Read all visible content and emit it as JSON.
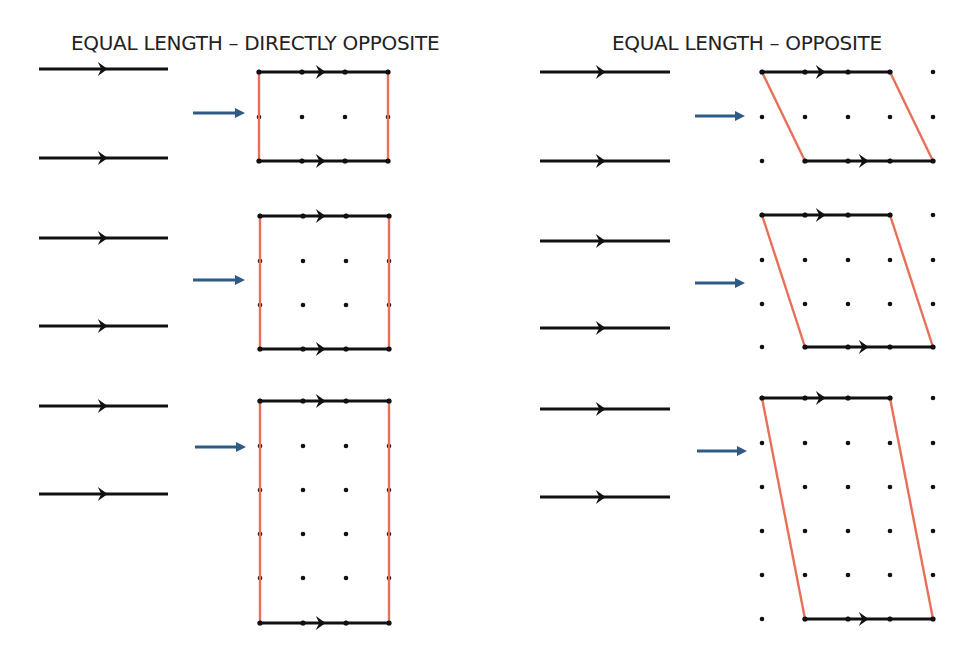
{
  "panels": [
    {
      "title": "EQUAL LENGTH – DIRECTLY OPPOSITE",
      "title_x": 71,
      "segments": {
        "x1": 39,
        "x2": 168,
        "arrow_x": 102,
        "groups": [
          {
            "y": [
              69,
              158
            ]
          },
          {
            "y": [
              238,
              326
            ]
          },
          {
            "y": [
              406,
              494
            ]
          }
        ]
      },
      "shapes": [
        {
          "label": "rectangle-2x1",
          "kind": "rectangle",
          "blue_arrow": {
            "x1": 193,
            "x2": 245,
            "y": 113
          },
          "cols": [
            259,
            302,
            345,
            388
          ],
          "rows": [
            72,
            117,
            161
          ],
          "top_edge": {
            "from": [
              259,
              72
            ],
            "to": [
              388,
              72
            ],
            "arrow_x": 320
          },
          "bottom_edge": {
            "from": [
              259,
              161
            ],
            "to": [
              388,
              161
            ],
            "arrow_x": 320
          },
          "left_edge": {
            "from": [
              259,
              72
            ],
            "to": [
              259,
              161
            ]
          },
          "right_edge": {
            "from": [
              388,
              72
            ],
            "to": [
              388,
              161
            ]
          }
        },
        {
          "label": "rectangle-3x3",
          "kind": "rectangle",
          "blue_arrow": {
            "x1": 193,
            "x2": 245,
            "y": 280
          },
          "cols": [
            260,
            303,
            346,
            389
          ],
          "rows": [
            216,
            261,
            305,
            349
          ],
          "top_edge": {
            "from": [
              260,
              216
            ],
            "to": [
              389,
              216
            ],
            "arrow_x": 320
          },
          "bottom_edge": {
            "from": [
              260,
              349
            ],
            "to": [
              389,
              349
            ],
            "arrow_x": 320
          },
          "left_edge": {
            "from": [
              260,
              216
            ],
            "to": [
              260,
              349
            ]
          },
          "right_edge": {
            "from": [
              389,
              216
            ],
            "to": [
              389,
              349
            ]
          }
        },
        {
          "label": "rectangle-3x5",
          "kind": "rectangle",
          "blue_arrow": {
            "x1": 195,
            "x2": 246,
            "y": 447
          },
          "cols": [
            260,
            303,
            346,
            389
          ],
          "rows": [
            401,
            446,
            490,
            534,
            578,
            623
          ],
          "top_edge": {
            "from": [
              260,
              401
            ],
            "to": [
              389,
              401
            ],
            "arrow_x": 320
          },
          "bottom_edge": {
            "from": [
              260,
              623
            ],
            "to": [
              389,
              623
            ],
            "arrow_x": 320
          },
          "left_edge": {
            "from": [
              260,
              401
            ],
            "to": [
              260,
              623
            ]
          },
          "right_edge": {
            "from": [
              389,
              401
            ],
            "to": [
              389,
              623
            ]
          }
        }
      ]
    },
    {
      "title": "EQUAL LENGTH – OPPOSITE",
      "title_x": 612,
      "segments": {
        "x1": 540,
        "x2": 670,
        "arrow_x": 600,
        "groups": [
          {
            "y": [
              72,
              161
            ]
          },
          {
            "y": [
              241,
              328
            ]
          },
          {
            "y": [
              409,
              497
            ]
          }
        ]
      },
      "shapes": [
        {
          "label": "parallelogram-small",
          "kind": "parallelogram",
          "blue_arrow": {
            "x1": 695,
            "x2": 745,
            "y": 116
          },
          "cols": [
            762,
            805,
            848,
            890,
            933
          ],
          "rows": [
            72,
            117,
            161
          ],
          "top_edge": {
            "from": [
              762,
              72
            ],
            "to": [
              890,
              72
            ],
            "arrow_x": 820
          },
          "bottom_edge": {
            "from": [
              805,
              161
            ],
            "to": [
              933,
              161
            ],
            "arrow_x": 863
          },
          "left_edge": {
            "from": [
              762,
              72
            ],
            "to": [
              805,
              161
            ]
          },
          "right_edge": {
            "from": [
              890,
              72
            ],
            "to": [
              933,
              161
            ]
          }
        },
        {
          "label": "parallelogram-medium",
          "kind": "parallelogram",
          "blue_arrow": {
            "x1": 695,
            "x2": 745,
            "y": 283
          },
          "cols": [
            762,
            805,
            848,
            890,
            933
          ],
          "rows": [
            215,
            260,
            304,
            347
          ],
          "top_edge": {
            "from": [
              762,
              215
            ],
            "to": [
              890,
              215
            ],
            "arrow_x": 820
          },
          "bottom_edge": {
            "from": [
              805,
              347
            ],
            "to": [
              933,
              347
            ],
            "arrow_x": 863
          },
          "left_edge": {
            "from": [
              762,
              215
            ],
            "to": [
              805,
              347
            ]
          },
          "right_edge": {
            "from": [
              890,
              215
            ],
            "to": [
              933,
              347
            ]
          }
        },
        {
          "label": "parallelogram-tall",
          "kind": "parallelogram",
          "blue_arrow": {
            "x1": 697,
            "x2": 747,
            "y": 451
          },
          "cols": [
            762,
            805,
            848,
            890,
            933
          ],
          "rows": [
            398,
            443,
            487,
            531,
            575,
            619
          ],
          "top_edge": {
            "from": [
              762,
              398
            ],
            "to": [
              890,
              398
            ],
            "arrow_x": 820
          },
          "bottom_edge": {
            "from": [
              805,
              619
            ],
            "to": [
              933,
              619
            ],
            "arrow_x": 863
          },
          "left_edge": {
            "from": [
              762,
              398
            ],
            "to": [
              805,
              619
            ]
          },
          "right_edge": {
            "from": [
              890,
              398
            ],
            "to": [
              933,
              619
            ]
          }
        }
      ]
    }
  ],
  "colors": {
    "line": "#111111",
    "side": "#e8705a",
    "blue_arrow": "#2f5a86",
    "dot": "#111111",
    "title": "#222222"
  }
}
